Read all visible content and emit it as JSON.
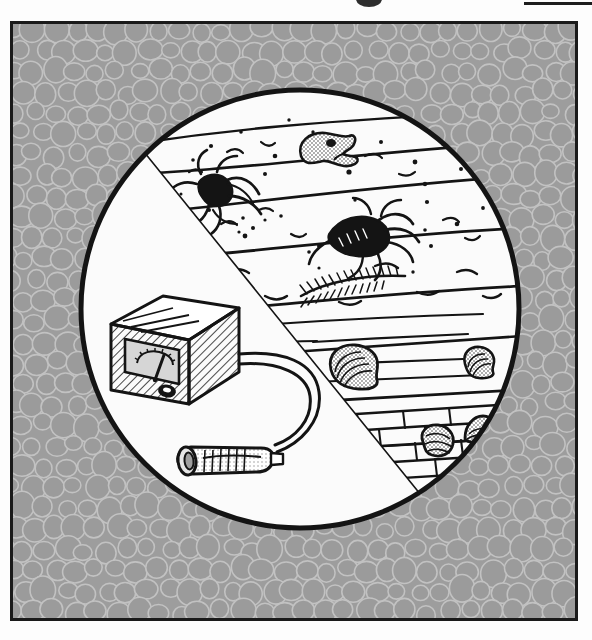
{
  "page": {
    "background_color": "#fdfdfd",
    "bleed_marks": [
      {
        "name": "cut-off-glyph-top-center",
        "shape": "blob"
      },
      {
        "name": "cut-off-rule-top-right",
        "shape": "rule"
      }
    ]
  },
  "frame": {
    "name": "illustration-frame",
    "border_color": "#1a1a1a",
    "fill_color": "#9d9d9d",
    "texture": "cobblestone-pebbles",
    "texture_pebble_color": "#9b9b9b",
    "texture_outline_color": "#c2c2c2"
  },
  "illustration": {
    "title": "Metal detector surveying buried archaeological strata",
    "medium": "black-and-white line drawing with halftone shading",
    "vignette": {
      "shape": "circle",
      "center_x": 287,
      "center_y": 285,
      "radius": 221,
      "fill_color": "#fbfbfb",
      "outline_color": "#141414",
      "outline_width": 5
    },
    "divider": {
      "name": "diagonal-cutaway-line",
      "description": "diagonal line separating the blank foreground ground surface from the excavated geological cross-section",
      "from_x": 130,
      "from_y": 130,
      "to_x": 430,
      "to_y": 500
    },
    "strata": [
      {
        "index": 1,
        "name": "topsoil-layer",
        "contents": [
          "animal-skull-fossil",
          "scorpion-fossil",
          "gravel-specks"
        ]
      },
      {
        "index": 2,
        "name": "second-sediment-layer",
        "contents": [
          "trilobite-fossil",
          "pebble-specks"
        ]
      },
      {
        "index": 3,
        "name": "plant-fossil-layer",
        "contents": [
          "fern-frond-fossil",
          "debris-dashes"
        ]
      },
      {
        "index": 4,
        "name": "shell-layer",
        "contents": [
          "large-ammonite-shell",
          "small-ammonite-shell"
        ]
      },
      {
        "index": 5,
        "name": "brick-masonry-layer",
        "contents": [
          "brick-wall-courses",
          "buried-artifact-left",
          "buried-artifact-right"
        ]
      }
    ],
    "objects": [
      {
        "name": "metal-detector-control-box",
        "description": "cube-shaped control unit with hatched shading, an analogue gauge dial with needle, and a round knob",
        "x": 100,
        "y": 280,
        "width": 125,
        "height": 105,
        "parts": [
          "gauge-dial",
          "gauge-needle",
          "control-knob",
          "hatched-shading"
        ]
      },
      {
        "name": "detector-probe-wand",
        "description": "handheld cylindrical search probe lying on the ground",
        "x": 160,
        "y": 425,
        "width": 110,
        "height": 40
      },
      {
        "name": "connecting-cable",
        "description": "curved cable running from the probe up to the right side of the control box",
        "x": 215,
        "y": 330,
        "width": 120,
        "height": 125
      }
    ],
    "fossils": [
      {
        "name": "animal-skull-fossil",
        "layer": 1,
        "x": 300,
        "y": 120,
        "shading": "stipple-gray"
      },
      {
        "name": "scorpion-fossil",
        "layer": 1,
        "x": 200,
        "y": 165,
        "shading": "solid-black"
      },
      {
        "name": "trilobite-fossil",
        "layer": 2,
        "x": 360,
        "y": 200,
        "shading": "solid-black"
      },
      {
        "name": "fern-frond-fossil",
        "layer": 3,
        "x": 300,
        "y": 262,
        "shading": "fine-line"
      },
      {
        "name": "large-ammonite-shell",
        "layer": 4,
        "x": 340,
        "y": 340,
        "shading": "stipple-gray"
      },
      {
        "name": "small-ammonite-shell",
        "layer": 4,
        "x": 465,
        "y": 333,
        "shading": "stipple-gray"
      },
      {
        "name": "buried-artifact-left",
        "layer": 5,
        "x": 425,
        "y": 415,
        "shading": "stipple-gray"
      },
      {
        "name": "buried-artifact-right",
        "layer": 5,
        "x": 465,
        "y": 405,
        "shading": "stipple-gray"
      }
    ]
  }
}
